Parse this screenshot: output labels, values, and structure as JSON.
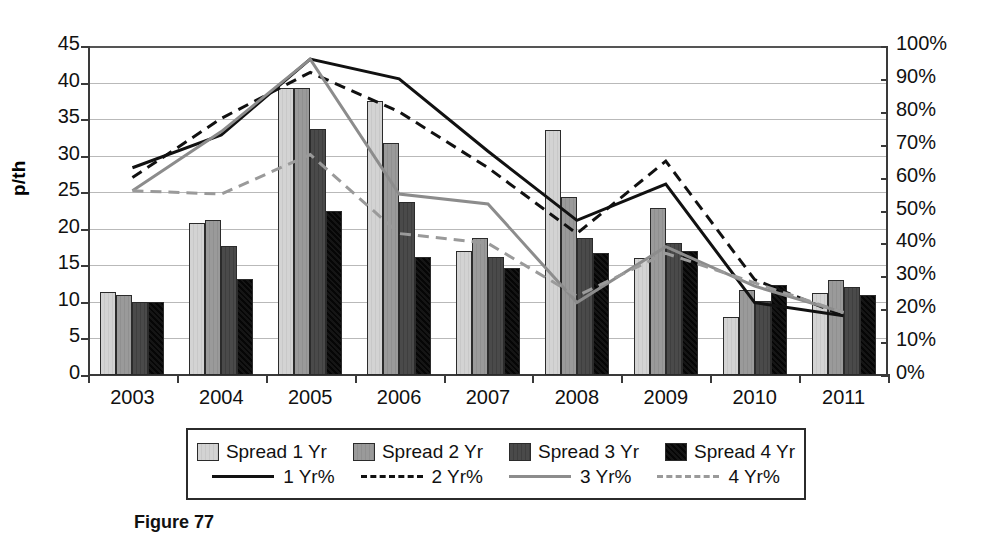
{
  "caption": "Figure 77",
  "chart_data": {
    "type": "bar",
    "title": "",
    "subtitle": "",
    "xlabel": "",
    "ylabel": "p/th",
    "ylabel_right": "",
    "categories": [
      "2003",
      "2004",
      "2005",
      "2006",
      "2007",
      "2008",
      "2009",
      "2010",
      "2011"
    ],
    "ylim": [
      0,
      45
    ],
    "ytick_step": 5,
    "yticks": [
      "0",
      "5",
      "10",
      "15",
      "20",
      "25",
      "30",
      "35",
      "40",
      "45"
    ],
    "ylim_right": [
      0,
      100
    ],
    "yticks_right": [
      "0%",
      "10%",
      "20%",
      "30%",
      "40%",
      "50%",
      "60%",
      "70%",
      "80%",
      "90%",
      "100%"
    ],
    "grid": true,
    "legend_position": "bottom",
    "bar_series": [
      {
        "name": "Spread 1 Yr",
        "axis": "left",
        "fill": "light-gray",
        "color": "#d3d3d3",
        "values": [
          11.4,
          20.8,
          39.3,
          37.5,
          16.9,
          33.5,
          16.0,
          8.0,
          11.2
        ]
      },
      {
        "name": "Spread 2 Yr",
        "axis": "left",
        "fill": "mid-gray",
        "color": "#9a9a9a",
        "values": [
          10.9,
          21.2,
          39.2,
          31.7,
          18.7,
          24.3,
          22.9,
          11.6,
          13.0
        ]
      },
      {
        "name": "Spread 3 Yr",
        "axis": "left",
        "fill": "dark-gray",
        "color": "#4a4a4a",
        "values": [
          10.0,
          17.7,
          33.7,
          23.6,
          16.1,
          18.8,
          18.1,
          10.1,
          12.0
        ]
      },
      {
        "name": "Spread 4 Yr",
        "axis": "left",
        "fill": "black",
        "color": "#0d0d0d",
        "values": [
          10.0,
          13.1,
          22.4,
          16.1,
          14.6,
          16.7,
          17.0,
          12.3,
          10.9
        ]
      }
    ],
    "line_series": [
      {
        "name": "1 Yr%",
        "axis": "right",
        "style": "solid",
        "color": "#111111",
        "width": 3,
        "values": [
          63,
          73,
          96,
          90,
          68,
          47,
          58,
          22,
          18
        ]
      },
      {
        "name": "2 Yr%",
        "axis": "right",
        "style": "dashed",
        "color": "#111111",
        "width": 3,
        "values": [
          60,
          78,
          92,
          80,
          63,
          43,
          65,
          29,
          18
        ]
      },
      {
        "name": "3 Yr%",
        "axis": "right",
        "style": "solid",
        "color": "#8c8c8c",
        "width": 3,
        "values": [
          56,
          74,
          96,
          55,
          52,
          22,
          39,
          27,
          19
        ]
      },
      {
        "name": "4 Yr%",
        "axis": "right",
        "style": "dashed",
        "color": "#9a9a9a",
        "width": 3,
        "values": [
          56,
          55,
          67,
          43,
          40,
          24,
          37,
          28,
          19
        ]
      }
    ]
  },
  "legend": {
    "bar_entries": [
      "Spread 1 Yr",
      "Spread 2 Yr",
      "Spread 3 Yr",
      "Spread 4 Yr"
    ],
    "line_entries": [
      "1 Yr%",
      "2 Yr%",
      "3 Yr%",
      "4 Yr%"
    ]
  }
}
